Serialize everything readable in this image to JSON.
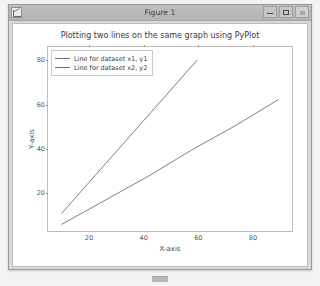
{
  "window": {
    "title": "Figure 1",
    "app_icon": "matplotlib-figure-icon",
    "controls": {
      "minimize_label": "—",
      "maximize_label": "❐",
      "close_label": "✕"
    }
  },
  "chart_data": {
    "type": "line",
    "title": "Plotting two lines on the same graph using PyPlot",
    "xlabel": "X-axis",
    "ylabel": "Y-axis",
    "grid": false,
    "legend_position": "upper left",
    "xlim": [
      5,
      95
    ],
    "ylim": [
      2,
      86
    ],
    "xticks": [
      20,
      40,
      60,
      80
    ],
    "yticks": [
      20,
      40,
      60,
      80
    ],
    "xtick_labels": [
      "20",
      "40",
      "60",
      "80"
    ],
    "ytick_labels": [
      "20",
      "40",
      "60",
      "80"
    ],
    "series": [
      {
        "name": "Line for dataset x1, y1",
        "color": "#6b6f78",
        "x": [
          10,
          20,
          30,
          40,
          50,
          60
        ],
        "y": [
          10,
          24,
          38,
          52,
          66,
          80
        ]
      },
      {
        "name": "Line for dataset x2, y2",
        "color": "#6b6f78",
        "x": [
          10,
          26,
          42,
          58,
          74,
          90
        ],
        "y": [
          5,
          16,
          27,
          39,
          50,
          62
        ]
      }
    ]
  },
  "taskbar": {
    "item_name": "figure-taskbar-entry"
  }
}
